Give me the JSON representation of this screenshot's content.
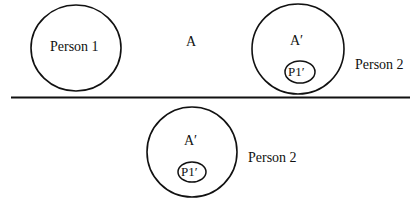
{
  "top_panel": {
    "person1_label": "Person 1",
    "a_label": "A",
    "inner_a_label": "A′",
    "p1_label": "P1′",
    "person2_label": "Person 2"
  },
  "bottom_panel": {
    "inner_a_label": "A′",
    "p1_label": "P1′",
    "person2_label": "Person 2"
  },
  "colors": {
    "stroke": "#111111",
    "background": "#ffffff"
  }
}
